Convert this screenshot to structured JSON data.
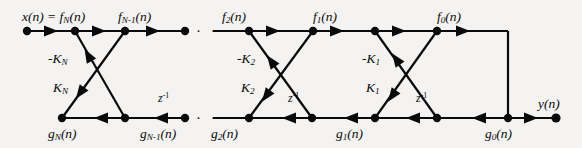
{
  "figure": {
    "type": "signal-flow-graph",
    "name": "all-pole-lattice-filter",
    "background_color": "#f4f3f1",
    "line_color": "#0a0a0a",
    "width": 582,
    "height": 148
  },
  "geometry": {
    "top_rail_y": 31,
    "bottom_rail_y": 118,
    "input_node_x": 27,
    "output_node_x": 556,
    "right_bus_x": 508
  },
  "labels": {
    "input": {
      "text": "x(n) = f",
      "sub": "N",
      "tail": "(n)"
    },
    "output": {
      "text": "y",
      "tail": "(n)"
    },
    "forward": [
      {
        "base": "f",
        "sub": "N-1",
        "tail": "(n)",
        "x": 118,
        "y": 14
      },
      {
        "base": "f",
        "sub": "2",
        "tail": "(n)",
        "x": 222,
        "y": 14
      },
      {
        "base": "f",
        "sub": "1",
        "tail": "(n)",
        "x": 313,
        "y": 14
      },
      {
        "base": "f",
        "sub": "0",
        "tail": "(n)",
        "x": 437,
        "y": 14
      }
    ],
    "backward": [
      {
        "base": "g",
        "sub": "N",
        "tail": "(n)",
        "x": 53,
        "y": 128
      },
      {
        "base": "g",
        "sub": "N-1",
        "tail": "(n)",
        "x": 144,
        "y": 128
      },
      {
        "base": "g",
        "sub": "2",
        "tail": "(n)",
        "x": 213,
        "y": 128
      },
      {
        "base": "g",
        "sub": "1",
        "tail": "(n)",
        "x": 338,
        "y": 128
      },
      {
        "base": "g",
        "sub": "0",
        "tail": "(n)",
        "x": 487,
        "y": 128
      }
    ],
    "coefficients_negative": [
      {
        "text": "-K",
        "sub": "N",
        "x": 52,
        "y": 57
      },
      {
        "text": "-K",
        "sub": "2",
        "x": 241,
        "y": 57
      },
      {
        "text": "-K",
        "sub": "1",
        "x": 366,
        "y": 57
      }
    ],
    "coefficients_positive": [
      {
        "text": "K",
        "sub": "N",
        "x": 56,
        "y": 85
      },
      {
        "text": "K",
        "sub": "2",
        "x": 244,
        "y": 85
      },
      {
        "text": "K",
        "sub": "1",
        "x": 369,
        "y": 85
      }
    ],
    "delays": [
      {
        "base": "z",
        "sup": "-1",
        "x": 160,
        "y": 95
      },
      {
        "base": "z",
        "sup": "-1",
        "x": 290,
        "y": 95
      },
      {
        "base": "z",
        "sup": "-1",
        "x": 418,
        "y": 95
      }
    ],
    "ellipsis_top": {
      "text": "· · ·",
      "x": 196,
      "y": 24
    },
    "ellipsis_bottom": {
      "text": "· · ·",
      "x": 196,
      "y": 111
    }
  },
  "nodes": {
    "top": [
      27,
      75,
      125,
      185,
      249,
      313,
      375,
      437
    ],
    "bottom": [
      62,
      125,
      185,
      249,
      312,
      375,
      437,
      508
    ],
    "output": 556
  },
  "stages": [
    {
      "id": "stage-N",
      "top_left": 75,
      "top_right": 125,
      "bottom_left": 62,
      "bottom_right": 125
    },
    {
      "id": "stage-2",
      "top_left": 249,
      "top_right": 313,
      "bottom_left": 249,
      "bottom_right": 312
    },
    {
      "id": "stage-1",
      "top_left": 375,
      "top_right": 437,
      "bottom_left": 375,
      "bottom_right": 437
    }
  ]
}
